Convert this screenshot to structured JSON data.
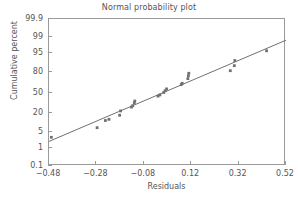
{
  "chart_data": {
    "type": "scatter",
    "title": "Normal probability plot",
    "xlabel": "Residuals",
    "ylabel": "Cumulative percent",
    "xlim": [
      -0.48,
      0.52
    ],
    "ylim": [
      0.1,
      99.9
    ],
    "yscale": "normal-probability",
    "grid": false,
    "legend": null,
    "xticks": [
      "-0.48",
      "-0.28",
      "-0.08",
      "0.12",
      "0.32",
      "0.52"
    ],
    "xtick_values": [
      -0.48,
      -0.28,
      -0.08,
      0.12,
      0.32,
      0.52
    ],
    "yticks": [
      "99.9",
      "99",
      "95",
      "80",
      "50",
      "20",
      "5",
      "1",
      "0.1"
    ],
    "ytick_values": [
      99.9,
      99,
      95,
      80,
      50,
      20,
      5,
      1,
      0.1
    ],
    "marker_color": "#707070",
    "line_color": "#707070",
    "axis_color": "#9a9a9a",
    "text_color": "#555555",
    "points": [
      {
        "x": -0.47,
        "y": 3.0
      },
      {
        "x": -0.277,
        "y": 7.0
      },
      {
        "x": -0.242,
        "y": 12.0
      },
      {
        "x": -0.227,
        "y": 13.0
      },
      {
        "x": -0.182,
        "y": 17.0
      },
      {
        "x": -0.178,
        "y": 22.0
      },
      {
        "x": -0.132,
        "y": 27.0
      },
      {
        "x": -0.127,
        "y": 29.0
      },
      {
        "x": -0.12,
        "y": 33.0
      },
      {
        "x": -0.118,
        "y": 36.0
      },
      {
        "x": -0.02,
        "y": 44.0
      },
      {
        "x": -0.012,
        "y": 46.0
      },
      {
        "x": 0.004,
        "y": 50.0
      },
      {
        "x": 0.01,
        "y": 53.0
      },
      {
        "x": 0.016,
        "y": 56.0
      },
      {
        "x": 0.078,
        "y": 63.0
      },
      {
        "x": 0.082,
        "y": 65.0
      },
      {
        "x": 0.106,
        "y": 72.0
      },
      {
        "x": 0.108,
        "y": 76.0
      },
      {
        "x": 0.11,
        "y": 79.0
      },
      {
        "x": 0.285,
        "y": 82.0
      },
      {
        "x": 0.302,
        "y": 87.0
      },
      {
        "x": 0.304,
        "y": 91.0
      },
      {
        "x": 0.438,
        "y": 96.0
      }
    ],
    "reference_line": {
      "label": "fitted normal reference line",
      "x_start": -0.48,
      "y_start": 2.0,
      "x_end": 0.52,
      "y_end": 98.6
    }
  }
}
